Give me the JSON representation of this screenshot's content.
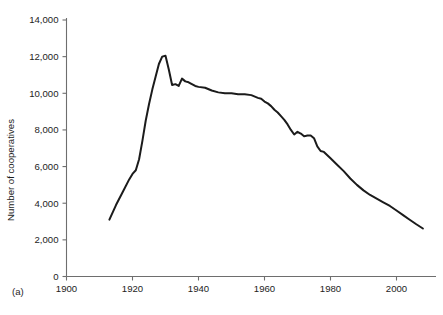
{
  "panel": {
    "label": "(a)"
  },
  "chart_data": {
    "type": "line",
    "title": "",
    "subtitle": "",
    "xlabel": "",
    "ylabel": "Number of cooperatives",
    "xlim": [
      1900,
      2012
    ],
    "ylim": [
      0,
      14000
    ],
    "grid": false,
    "legend": null,
    "legend_position": "none",
    "xticks": [
      1900,
      1920,
      1940,
      1960,
      1980,
      2000
    ],
    "xticklabels": [
      "1900",
      "1920",
      "1940",
      "1960",
      "1980",
      "2000"
    ],
    "yticks": [
      0,
      2000,
      4000,
      6000,
      8000,
      10000,
      12000,
      14000
    ],
    "yticklabels": [
      "0",
      "2,000",
      "4,000",
      "6,000",
      "8,000",
      "10,000",
      "12,000",
      "14,000"
    ],
    "series": [
      {
        "name": "Number of cooperatives",
        "color": "#1b1b1b",
        "x": [
          1913,
          1915,
          1917,
          1919,
          1920,
          1921,
          1922,
          1923,
          1924,
          1925,
          1926,
          1927,
          1928,
          1929,
          1930,
          1931,
          1932,
          1933,
          1934,
          1935,
          1936,
          1937,
          1938,
          1939,
          1940,
          1942,
          1944,
          1946,
          1948,
          1950,
          1952,
          1954,
          1956,
          1958,
          1959,
          1960,
          1961,
          1962,
          1963,
          1964,
          1965,
          1966,
          1967,
          1968,
          1969,
          1970,
          1971,
          1972,
          1973,
          1974,
          1975,
          1976,
          1977,
          1978,
          1980,
          1982,
          1984,
          1986,
          1988,
          1990,
          1992,
          1994,
          1996,
          1998,
          2000,
          2002,
          2004,
          2006,
          2008
        ],
        "values": [
          3100,
          3900,
          4600,
          5300,
          5600,
          5800,
          6400,
          7400,
          8500,
          9400,
          10200,
          10900,
          11600,
          12000,
          12050,
          11300,
          10450,
          10500,
          10400,
          10800,
          10650,
          10600,
          10500,
          10400,
          10350,
          10300,
          10150,
          10050,
          10000,
          10000,
          9950,
          9950,
          9900,
          9750,
          9700,
          9550,
          9450,
          9300,
          9100,
          8950,
          8750,
          8550,
          8300,
          8000,
          7750,
          7900,
          7800,
          7650,
          7700,
          7700,
          7550,
          7100,
          6850,
          6800,
          6450,
          6100,
          5750,
          5350,
          5000,
          4700,
          4450,
          4250,
          4050,
          3850,
          3600,
          3350,
          3100,
          2850,
          2620
        ]
      }
    ],
    "annotations": []
  }
}
